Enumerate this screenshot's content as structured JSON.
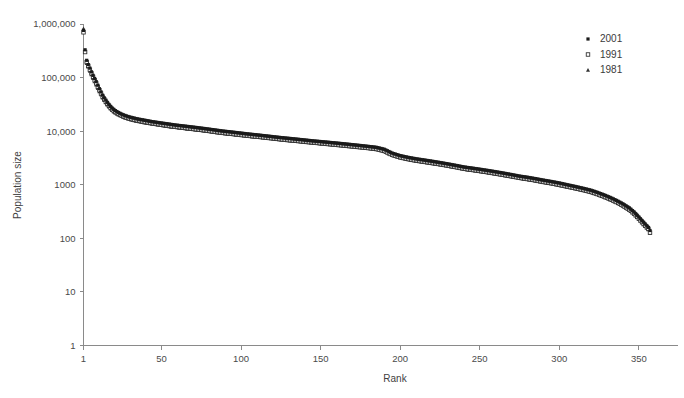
{
  "chart_data": {
    "type": "scatter",
    "title": "",
    "xlabel": "Rank",
    "ylabel": "Population size",
    "xlim": [
      1,
      357
    ],
    "ylim": [
      1,
      1000000
    ],
    "yscale": "log",
    "xscale": "linear",
    "grid": false,
    "legend_position": "top-right",
    "xticks": [
      1,
      50,
      100,
      150,
      200,
      250,
      300,
      350
    ],
    "xtick_labels": [
      "1",
      "50",
      "100",
      "150",
      "200",
      "250",
      "300",
      "350"
    ],
    "yticks": [
      1,
      10,
      100,
      1000,
      10000,
      100000,
      1000000
    ],
    "ytick_labels": [
      "1",
      "10",
      "100",
      "1000",
      "10,000",
      "100,000",
      "1,000,000"
    ],
    "markers": {
      "2001": "filled-square",
      "1991": "open-square",
      "1981": "filled-triangle"
    },
    "colors": {
      "2001": "#1a1a1a",
      "1991": "#2b2b2b",
      "1981": "#333333"
    },
    "series": [
      {
        "name": "2001",
        "marker": "filled-square",
        "x": [
          1,
          2,
          3,
          4,
          5,
          6,
          7,
          8,
          9,
          10,
          11,
          12,
          13,
          14,
          15,
          16,
          17,
          18,
          19,
          20,
          21,
          22,
          23,
          24,
          25,
          26,
          27,
          28,
          29,
          30,
          32,
          34,
          36,
          38,
          40,
          42,
          44,
          46,
          48,
          50,
          53,
          56,
          59,
          62,
          65,
          68,
          71,
          74,
          77,
          80,
          84,
          88,
          92,
          96,
          100,
          104,
          108,
          112,
          116,
          120,
          125,
          130,
          135,
          140,
          145,
          150,
          155,
          160,
          165,
          170,
          175,
          180,
          185,
          190,
          195,
          200,
          205,
          210,
          215,
          220,
          225,
          230,
          235,
          240,
          245,
          250,
          255,
          260,
          265,
          270,
          275,
          280,
          285,
          290,
          295,
          300,
          305,
          310,
          315,
          320,
          324,
          328,
          332,
          336,
          340,
          344,
          347,
          350,
          352,
          354,
          356,
          357
        ],
        "y": [
          760000,
          330000,
          210000,
          175000,
          150000,
          128000,
          110000,
          96000,
          84000,
          72000,
          62000,
          54000,
          47000,
          42000,
          38000,
          34500,
          31500,
          29000,
          27000,
          25500,
          24200,
          23200,
          22300,
          21500,
          20800,
          20200,
          19700,
          19200,
          18800,
          18400,
          17800,
          17200,
          16700,
          16300,
          15900,
          15500,
          15100,
          14800,
          14500,
          14200,
          13800,
          13400,
          13000,
          12700,
          12400,
          12100,
          11800,
          11500,
          11200,
          10900,
          10500,
          10100,
          9800,
          9500,
          9200,
          8900,
          8650,
          8400,
          8150,
          7900,
          7600,
          7350,
          7100,
          6850,
          6600,
          6400,
          6200,
          6000,
          5800,
          5600,
          5400,
          5200,
          5000,
          4600,
          3900,
          3500,
          3250,
          3050,
          2900,
          2750,
          2600,
          2450,
          2300,
          2150,
          2050,
          1950,
          1850,
          1750,
          1650,
          1550,
          1450,
          1380,
          1300,
          1220,
          1150,
          1080,
          1000,
          930,
          860,
          790,
          720,
          650,
          580,
          510,
          440,
          370,
          310,
          250,
          215,
          185,
          160,
          140
        ],
        "comment": "2001 series: rank-size distribution of settlements, highest of the three"
      },
      {
        "name": "1991",
        "marker": "open-square",
        "x": [
          1,
          2,
          3,
          4,
          5,
          6,
          7,
          8,
          9,
          10,
          11,
          12,
          13,
          14,
          15,
          16,
          17,
          18,
          19,
          20,
          21,
          22,
          23,
          24,
          25,
          26,
          27,
          28,
          29,
          30,
          32,
          34,
          36,
          38,
          40,
          42,
          44,
          46,
          48,
          50,
          53,
          56,
          59,
          62,
          65,
          68,
          71,
          74,
          77,
          80,
          84,
          88,
          92,
          96,
          100,
          104,
          108,
          112,
          116,
          120,
          125,
          130,
          135,
          140,
          145,
          150,
          155,
          160,
          165,
          170,
          175,
          180,
          185,
          190,
          195,
          200,
          205,
          210,
          215,
          220,
          225,
          230,
          235,
          240,
          245,
          250,
          255,
          260,
          265,
          270,
          275,
          280,
          285,
          290,
          295,
          300,
          305,
          310,
          315,
          320,
          324,
          328,
          332,
          336,
          340,
          344,
          347,
          350,
          352,
          354,
          356,
          357
        ],
        "y": [
          700000,
          300000,
          195000,
          165000,
          140000,
          120000,
          103000,
          89000,
          78000,
          67000,
          58000,
          50500,
          44000,
          39500,
          35500,
          32300,
          29600,
          27300,
          25400,
          24000,
          22800,
          21800,
          21000,
          20200,
          19600,
          19000,
          18500,
          18000,
          17600,
          17200,
          16600,
          16100,
          15600,
          15200,
          14800,
          14400,
          14100,
          13800,
          13500,
          13200,
          12800,
          12400,
          12100,
          11800,
          11500,
          11200,
          10900,
          10650,
          10400,
          10100,
          9700,
          9350,
          9050,
          8800,
          8500,
          8250,
          8000,
          7800,
          7550,
          7350,
          7050,
          6800,
          6600,
          6350,
          6150,
          5950,
          5750,
          5570,
          5380,
          5200,
          5020,
          4850,
          4650,
          4280,
          3620,
          3250,
          3020,
          2830,
          2690,
          2550,
          2420,
          2280,
          2140,
          2000,
          1900,
          1810,
          1720,
          1620,
          1530,
          1440,
          1350,
          1280,
          1210,
          1130,
          1070,
          1000,
          930,
          865,
          800,
          735,
          670,
          605,
          540,
          475,
          410,
          345,
          290,
          233,
          200,
          172,
          150,
          128
        ],
        "comment": "1991 series: slightly below 2001 across most ranks"
      },
      {
        "name": "1981",
        "marker": "filled-triangle",
        "x": [
          1,
          2,
          3,
          4,
          5,
          6,
          7,
          8,
          9,
          10,
          11,
          12,
          13,
          14,
          15,
          16,
          17,
          18,
          19,
          20,
          21,
          22,
          23,
          24,
          25,
          26,
          27,
          28,
          29,
          30,
          32,
          34,
          36,
          38,
          40,
          42,
          44,
          46,
          48,
          50,
          53,
          56,
          59,
          62,
          65,
          68,
          71,
          74,
          77,
          80,
          84,
          88,
          92,
          96,
          100,
          104,
          108,
          112,
          116,
          120,
          125,
          130,
          135,
          140,
          145,
          150,
          155,
          160,
          165,
          170,
          175,
          180,
          185,
          190,
          195,
          200,
          205,
          210,
          215,
          220,
          225,
          230,
          235,
          240,
          245,
          250,
          255,
          260,
          265,
          270,
          275,
          280,
          285,
          290,
          295,
          300,
          305,
          310,
          315,
          320,
          324,
          328,
          332,
          336,
          340,
          344,
          347,
          350,
          352,
          354,
          356,
          357
        ],
        "y": [
          820000,
          310000,
          185000,
          158000,
          133000,
          114000,
          97000,
          84000,
          73000,
          63000,
          55000,
          48000,
          42000,
          37500,
          34000,
          31000,
          28400,
          26200,
          24400,
          23000,
          21900,
          21000,
          20200,
          19500,
          18900,
          18300,
          17800,
          17400,
          17000,
          16600,
          16000,
          15500,
          15100,
          14700,
          14300,
          14000,
          13700,
          13400,
          13100,
          12800,
          12400,
          12100,
          11800,
          11500,
          11200,
          10950,
          10700,
          10400,
          10150,
          9900,
          9550,
          9200,
          8900,
          8650,
          8400,
          8150,
          7900,
          7700,
          7480,
          7280,
          6980,
          6750,
          6530,
          6300,
          6100,
          5900,
          5720,
          5540,
          5360,
          5180,
          5000,
          4830,
          4650,
          4250,
          3580,
          3200,
          2980,
          2800,
          2650,
          2510,
          2380,
          2250,
          2110,
          1970,
          1870,
          1780,
          1690,
          1600,
          1510,
          1420,
          1340,
          1260,
          1190,
          1120,
          1050,
          980,
          915,
          850,
          790,
          725,
          660,
          595,
          530,
          470,
          405,
          340,
          285,
          230,
          196,
          168,
          146,
          126
        ],
        "comment": "1981 series: interleaved with 1991, lowest of the three at most ranks"
      }
    ]
  },
  "axes": {
    "y_title": "Population size",
    "x_title": "Rank"
  },
  "legend": {
    "items": [
      {
        "label": "2001",
        "marker": "filled-square"
      },
      {
        "label": "1991",
        "marker": "open-square"
      },
      {
        "label": "1981",
        "marker": "filled-triangle"
      }
    ]
  }
}
